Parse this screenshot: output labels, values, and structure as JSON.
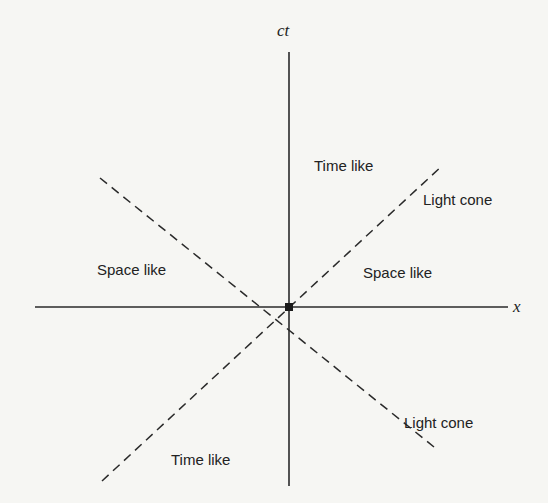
{
  "diagram": {
    "type": "spacetime-light-cone",
    "axes": {
      "vertical_label": "ct",
      "horizontal_label": "x"
    },
    "origin_marker": "event-point",
    "regions": {
      "future": "Time like",
      "past": "Time like",
      "left": "Space like",
      "right": "Space like"
    },
    "light_cone_labels": {
      "upper": "Light cone",
      "lower": "Light cone"
    },
    "colors": {
      "ink": "#222222",
      "background": "#f6f6f3"
    }
  }
}
